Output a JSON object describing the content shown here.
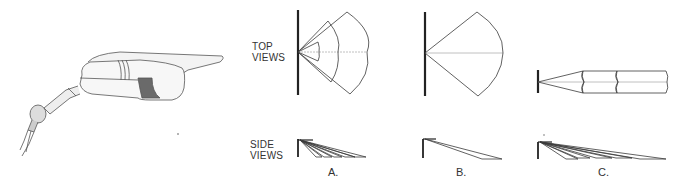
{
  "figure": {
    "row_labels": {
      "top_line1": "TOP",
      "top_line2": "VIEWS",
      "side_line1": "SIDE",
      "side_line2": "VIEWS"
    },
    "panels": [
      {
        "id": "A",
        "caption": "A.",
        "description": "Multiple nested wide beams (top) with fanned side throws"
      },
      {
        "id": "B",
        "caption": "B.",
        "description": "Single wide beam (top) with single side throw"
      },
      {
        "id": "C",
        "caption": "C.",
        "description": "Narrow segmented spot beams (top) with fanned long side throws"
      }
    ],
    "illustration": {
      "name": "floodlight-fixture",
      "description": "Pencil sketch of an angled floodlight fixture on a swivel knuckle mount"
    },
    "colors": {
      "line": "#3a3a3a",
      "wall": "#222222",
      "centerline": "#b0b0b0"
    }
  }
}
